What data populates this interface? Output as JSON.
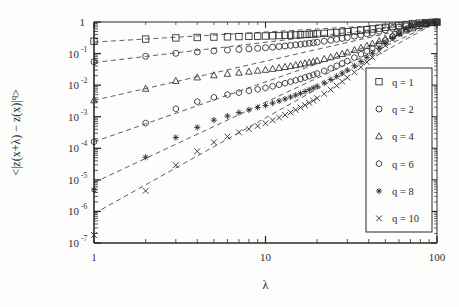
{
  "figure": {
    "background_color": "#fdfdfc",
    "ink_color": "#2b2b2b"
  },
  "chart_data": {
    "type": "scatter",
    "title": "",
    "xlabel": "λ",
    "ylabel": "<|z(x+λ) − z(x)|ᵖ>",
    "ylabel_parts": {
      "open": "<|z(x+λ) − z(x)|",
      "exponent": "q",
      "close": ">"
    },
    "xscale": "log",
    "yscale": "log",
    "xlim": [
      1,
      100
    ],
    "ylim": [
      1e-07,
      1
    ],
    "grid": false,
    "xticks": [
      1,
      10,
      100
    ],
    "xtick_labels": [
      "1",
      "10",
      "100"
    ],
    "yticks": [
      1,
      0.1,
      0.01,
      0.001,
      0.0001,
      1e-05,
      1e-06,
      1e-07
    ],
    "ytick_labels": [
      "1",
      "10⁻¹",
      "10⁻²",
      "10⁻³",
      "10⁻⁴",
      "10⁻⁵",
      "10⁻⁶",
      "10⁻⁷"
    ],
    "ytick_mantissa": [
      "1",
      "10",
      "10",
      "10",
      "10",
      "10",
      "10",
      "10"
    ],
    "ytick_exponent": [
      "",
      "-1",
      "-2",
      "-3",
      "-4",
      "-5",
      "-6",
      "-7"
    ],
    "legend_position": "right-center",
    "legend_entries": [
      {
        "label": "q = 1",
        "marker": "square"
      },
      {
        "label": "q = 2",
        "marker": "circle"
      },
      {
        "label": "q = 4",
        "marker": "triangle"
      },
      {
        "label": "q = 6",
        "marker": "hexagon"
      },
      {
        "label": "q = 8",
        "marker": "star"
      },
      {
        "label": "q = 10",
        "marker": "cross"
      }
    ],
    "series": [
      {
        "name": "q = 1",
        "marker": "square",
        "fit_line": {
          "x": [
            1,
            100
          ],
          "y": [
            0.232,
            1.0
          ]
        },
        "x": [
          1,
          2,
          3,
          4,
          5,
          6,
          7,
          8,
          9,
          10,
          11,
          12,
          13,
          14,
          15,
          16,
          17,
          18,
          19,
          20,
          22,
          24,
          26,
          28,
          30,
          33,
          36,
          39,
          42,
          46,
          50,
          55,
          60,
          66,
          72,
          79,
          86,
          94,
          100
        ],
        "y": [
          0.247,
          0.288,
          0.313,
          0.323,
          0.333,
          0.339,
          0.345,
          0.35,
          0.355,
          0.36,
          0.366,
          0.372,
          0.378,
          0.384,
          0.39,
          0.396,
          0.402,
          0.409,
          0.415,
          0.422,
          0.436,
          0.45,
          0.465,
          0.48,
          0.495,
          0.52,
          0.546,
          0.573,
          0.601,
          0.64,
          0.68,
          0.73,
          0.779,
          0.833,
          0.878,
          0.92,
          0.952,
          0.98,
          0.995
        ]
      },
      {
        "name": "q = 2",
        "marker": "circle",
        "fit_line": {
          "x": [
            1,
            100
          ],
          "y": [
            0.052,
            1.0
          ]
        },
        "x": [
          1,
          2,
          3,
          4,
          5,
          6,
          7,
          8,
          9,
          10,
          11,
          12,
          13,
          14,
          15,
          16,
          17,
          18,
          19,
          20,
          22,
          24,
          26,
          28,
          30,
          33,
          36,
          39,
          42,
          46,
          50,
          55,
          60,
          66,
          72,
          79,
          86,
          94,
          100
        ],
        "y": [
          0.055,
          0.082,
          0.102,
          0.113,
          0.122,
          0.129,
          0.135,
          0.141,
          0.147,
          0.153,
          0.16,
          0.167,
          0.174,
          0.181,
          0.188,
          0.196,
          0.204,
          0.212,
          0.22,
          0.229,
          0.246,
          0.264,
          0.283,
          0.303,
          0.323,
          0.355,
          0.389,
          0.424,
          0.46,
          0.51,
          0.562,
          0.626,
          0.688,
          0.757,
          0.815,
          0.872,
          0.918,
          0.96,
          0.988
        ]
      },
      {
        "name": "q = 4",
        "marker": "triangle",
        "fit_line": {
          "x": [
            1,
            100
          ],
          "y": [
            0.0033,
            1.0
          ]
        },
        "x": [
          1,
          2,
          3,
          4,
          5,
          6,
          7,
          8,
          9,
          10,
          11,
          12,
          13,
          14,
          15,
          16,
          17,
          18,
          19,
          20,
          22,
          24,
          26,
          28,
          30,
          33,
          36,
          39,
          42,
          46,
          50,
          55,
          60,
          66,
          72,
          79,
          86,
          94,
          100
        ],
        "y": [
          0.0033,
          0.0077,
          0.0136,
          0.0175,
          0.0205,
          0.0228,
          0.0248,
          0.0267,
          0.0286,
          0.0305,
          0.0327,
          0.035,
          0.0375,
          0.0401,
          0.0428,
          0.0457,
          0.0488,
          0.0521,
          0.0555,
          0.0592,
          0.0672,
          0.076,
          0.0858,
          0.0966,
          0.1085,
          0.1285,
          0.151,
          0.1765,
          0.205,
          0.248,
          0.296,
          0.364,
          0.438,
          0.535,
          0.63,
          0.74,
          0.83,
          0.92,
          0.975
        ]
      },
      {
        "name": "q = 6",
        "marker": "hexagon",
        "fit_line": {
          "x": [
            1,
            100
          ],
          "y": [
            0.00016,
            1.0
          ]
        },
        "x": [
          1,
          2,
          3,
          4,
          5,
          6,
          7,
          8,
          9,
          10,
          11,
          12,
          13,
          14,
          15,
          16,
          17,
          18,
          19,
          20,
          22,
          24,
          26,
          28,
          30,
          33,
          36,
          39,
          42,
          46,
          50,
          55,
          60,
          66,
          72,
          79,
          86,
          94,
          100
        ],
        "y": [
          0.00016,
          0.00063,
          0.00178,
          0.003,
          0.0041,
          0.005,
          0.0058,
          0.0066,
          0.0074,
          0.0082,
          0.0092,
          0.0103,
          0.0115,
          0.0128,
          0.0142,
          0.0157,
          0.0174,
          0.0192,
          0.0212,
          0.0234,
          0.0283,
          0.034,
          0.0408,
          0.0488,
          0.058,
          0.0745,
          0.095,
          0.12,
          0.15,
          0.2,
          0.26,
          0.35,
          0.45,
          0.59,
          0.71,
          0.83,
          0.91,
          0.965,
          0.99
        ]
      },
      {
        "name": "q = 8",
        "marker": "star",
        "fit_line": {
          "x": [
            1,
            100
          ],
          "y": [
            8.2e-06,
            1.0
          ]
        },
        "x": [
          1,
          2,
          3,
          4,
          5,
          6,
          7,
          8,
          9,
          10,
          11,
          12,
          13,
          14,
          15,
          16,
          17,
          18,
          19,
          20,
          22,
          24,
          26,
          28,
          30,
          33,
          36,
          39,
          42,
          46,
          50,
          55,
          60,
          66,
          72,
          79,
          86,
          94,
          100
        ],
        "y": [
          4.8e-06,
          5.2e-05,
          0.00022,
          0.00046,
          0.00078,
          0.00105,
          0.00135,
          0.00165,
          0.00196,
          0.00228,
          0.0027,
          0.00315,
          0.00365,
          0.0042,
          0.00482,
          0.0055,
          0.00628,
          0.00715,
          0.00812,
          0.0092,
          0.0118,
          0.015,
          0.019,
          0.024,
          0.03,
          0.041,
          0.056,
          0.076,
          0.102,
          0.148,
          0.21,
          0.31,
          0.43,
          0.6,
          0.74,
          0.87,
          0.94,
          0.98,
          0.995
        ]
      },
      {
        "name": "q = 10",
        "marker": "cross",
        "fit_line": {
          "x": [
            1,
            100
          ],
          "y": [
            8.5e-07,
            1.0
          ]
        },
        "x": [
          1,
          2,
          3,
          4,
          5,
          6,
          7,
          8,
          9,
          10,
          11,
          12,
          13,
          14,
          15,
          16,
          17,
          18,
          19,
          20,
          22,
          24,
          26,
          28,
          30,
          33,
          36,
          39,
          42,
          46,
          50,
          55,
          60,
          66,
          72,
          79,
          86,
          94,
          100
        ],
        "y": [
          1.8e-07,
          4.5e-06,
          2.9e-05,
          8e-05,
          0.000155,
          0.000235,
          0.00032,
          0.00041,
          0.00051,
          0.00062,
          0.00077,
          0.00094,
          0.00114,
          0.00137,
          0.00164,
          0.00195,
          0.00232,
          0.00275,
          0.00325,
          0.00385,
          0.0053,
          0.0072,
          0.0097,
          0.013,
          0.0173,
          0.0255,
          0.037,
          0.0535,
          0.076,
          0.118,
          0.18,
          0.285,
          0.42,
          0.61,
          0.77,
          0.89,
          0.95,
          0.985,
          0.996
        ]
      }
    ]
  }
}
